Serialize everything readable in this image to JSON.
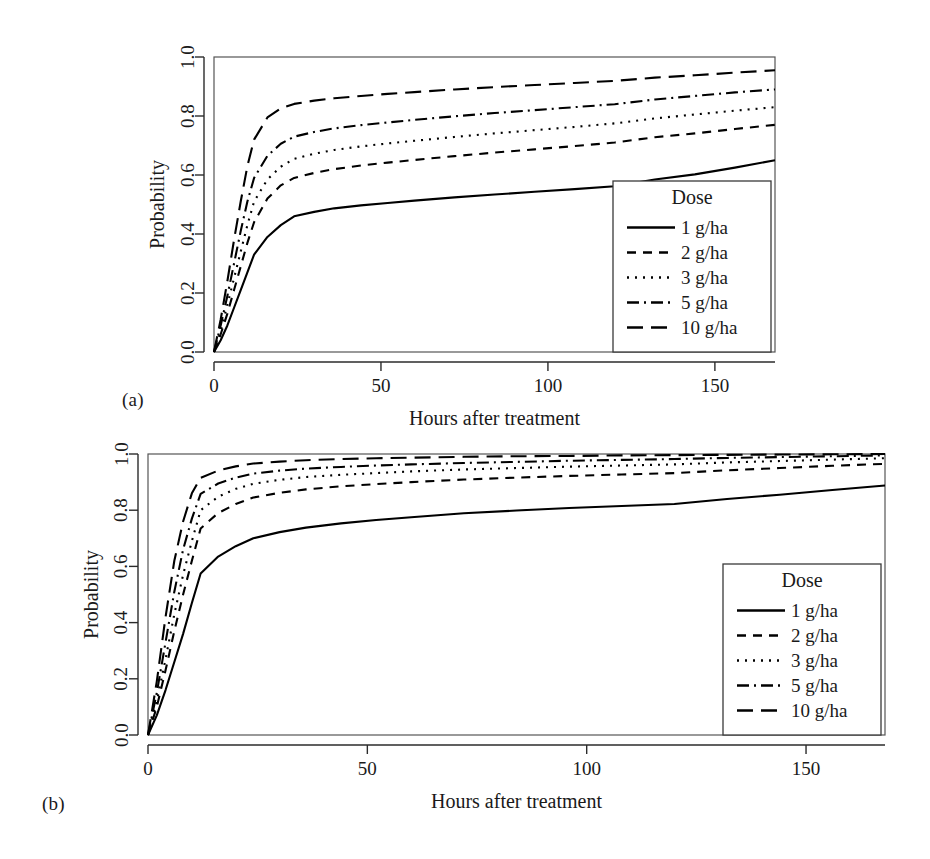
{
  "figure": {
    "panels": [
      {
        "id": "a",
        "caption": "(a)"
      },
      {
        "id": "b",
        "caption": "(b)"
      }
    ]
  },
  "chart_data": [
    {
      "panel": "a",
      "type": "line",
      "title": "",
      "xlabel": "Hours after treatment",
      "ylabel": "Probability",
      "xlim": [
        0,
        168
      ],
      "ylim": [
        0,
        1.0
      ],
      "xticks": [
        0,
        50,
        100,
        150
      ],
      "yticks": [
        0.0,
        0.2,
        0.4,
        0.6,
        0.8,
        1.0
      ],
      "ytick_labels": [
        "0.0",
        "0.2",
        "0.4",
        "0.6",
        "0.8",
        "1.0"
      ],
      "xtick_labels": [
        "0",
        "50",
        "100",
        "150"
      ],
      "grid": false,
      "legend": {
        "title": "Dose",
        "position": "bottom-right",
        "entries": [
          {
            "label": "1 g/ha",
            "dash": "solid"
          },
          {
            "label": "2 g/ha",
            "dash": "dashed"
          },
          {
            "label": "3 g/ha",
            "dash": "dotted"
          },
          {
            "label": "5 g/ha",
            "dash": "dashdot"
          },
          {
            "label": "10 g/ha",
            "dash": "longdash"
          }
        ]
      },
      "x": [
        0,
        2,
        4,
        6,
        8,
        10,
        12,
        16,
        20,
        24,
        30,
        36,
        44,
        52,
        60,
        72,
        84,
        96,
        108,
        120,
        132,
        144,
        156,
        168
      ],
      "series": [
        {
          "name": "1 g/ha",
          "dash": "solid",
          "values": [
            0.0,
            0.04,
            0.09,
            0.15,
            0.21,
            0.27,
            0.33,
            0.39,
            0.43,
            0.46,
            0.475,
            0.487,
            0.497,
            0.505,
            0.513,
            0.524,
            0.534,
            0.543,
            0.552,
            0.562,
            0.585,
            0.602,
            0.625,
            0.65
          ]
        },
        {
          "name": "2 g/ha",
          "dash": "dashed",
          "values": [
            0.0,
            0.06,
            0.13,
            0.21,
            0.29,
            0.37,
            0.44,
            0.52,
            0.565,
            0.59,
            0.607,
            0.62,
            0.632,
            0.642,
            0.651,
            0.664,
            0.676,
            0.687,
            0.698,
            0.71,
            0.728,
            0.741,
            0.756,
            0.77
          ]
        },
        {
          "name": "3 g/ha",
          "dash": "dotted",
          "values": [
            0.0,
            0.07,
            0.16,
            0.25,
            0.34,
            0.43,
            0.51,
            0.585,
            0.628,
            0.655,
            0.672,
            0.685,
            0.697,
            0.707,
            0.716,
            0.729,
            0.741,
            0.752,
            0.763,
            0.775,
            0.792,
            0.805,
            0.818,
            0.83
          ]
        },
        {
          "name": "5 g/ha",
          "dash": "dashdot",
          "values": [
            0.0,
            0.09,
            0.19,
            0.3,
            0.41,
            0.51,
            0.59,
            0.665,
            0.706,
            0.73,
            0.746,
            0.758,
            0.769,
            0.778,
            0.787,
            0.799,
            0.81,
            0.82,
            0.83,
            0.84,
            0.856,
            0.868,
            0.88,
            0.89
          ]
        },
        {
          "name": "10 g/ha",
          "dash": "longdash",
          "values": [
            0.0,
            0.11,
            0.24,
            0.38,
            0.51,
            0.63,
            0.72,
            0.795,
            0.826,
            0.841,
            0.852,
            0.86,
            0.868,
            0.875,
            0.881,
            0.89,
            0.898,
            0.905,
            0.912,
            0.919,
            0.93,
            0.938,
            0.947,
            0.955
          ]
        }
      ]
    },
    {
      "panel": "b",
      "type": "line",
      "title": "",
      "xlabel": "Hours after treatment",
      "ylabel": "Probability",
      "xlim": [
        0,
        168
      ],
      "ylim": [
        0,
        1.0
      ],
      "xticks": [
        0,
        50,
        100,
        150
      ],
      "yticks": [
        0.0,
        0.2,
        0.4,
        0.6,
        0.8,
        1.0
      ],
      "ytick_labels": [
        "0.0",
        "0.2",
        "0.4",
        "0.6",
        "0.8",
        "1.0"
      ],
      "xtick_labels": [
        "0",
        "50",
        "100",
        "150"
      ],
      "grid": false,
      "legend": {
        "title": "Dose",
        "position": "bottom-right",
        "entries": [
          {
            "label": "1 g/ha",
            "dash": "solid"
          },
          {
            "label": "2 g/ha",
            "dash": "dashed"
          },
          {
            "label": "3 g/ha",
            "dash": "dotted"
          },
          {
            "label": "5 g/ha",
            "dash": "dashdot"
          },
          {
            "label": "10 g/ha",
            "dash": "longdash"
          }
        ]
      },
      "x": [
        0,
        2,
        4,
        6,
        8,
        10,
        12,
        16,
        20,
        24,
        30,
        36,
        44,
        52,
        60,
        72,
        84,
        96,
        108,
        120,
        132,
        144,
        156,
        168
      ],
      "series": [
        {
          "name": "1 g/ha",
          "dash": "solid",
          "values": [
            0.0,
            0.07,
            0.16,
            0.26,
            0.36,
            0.47,
            0.575,
            0.635,
            0.672,
            0.7,
            0.722,
            0.738,
            0.753,
            0.765,
            0.775,
            0.789,
            0.799,
            0.808,
            0.815,
            0.822,
            0.84,
            0.855,
            0.872,
            0.888
          ]
        },
        {
          "name": "2 g/ha",
          "dash": "dashed",
          "values": [
            0.0,
            0.1,
            0.23,
            0.37,
            0.5,
            0.62,
            0.735,
            0.79,
            0.822,
            0.845,
            0.862,
            0.874,
            0.885,
            0.893,
            0.9,
            0.909,
            0.916,
            0.922,
            0.927,
            0.932,
            0.942,
            0.95,
            0.958,
            0.965
          ]
        },
        {
          "name": "3 g/ha",
          "dash": "dotted",
          "values": [
            0.0,
            0.12,
            0.27,
            0.43,
            0.57,
            0.69,
            0.8,
            0.848,
            0.876,
            0.894,
            0.908,
            0.918,
            0.926,
            0.932,
            0.938,
            0.945,
            0.95,
            0.955,
            0.959,
            0.963,
            0.97,
            0.975,
            0.98,
            0.985
          ]
        },
        {
          "name": "5 g/ha",
          "dash": "dashdot",
          "values": [
            0.0,
            0.15,
            0.33,
            0.51,
            0.66,
            0.77,
            0.858,
            0.895,
            0.916,
            0.93,
            0.941,
            0.948,
            0.954,
            0.959,
            0.963,
            0.968,
            0.972,
            0.976,
            0.979,
            0.982,
            0.986,
            0.989,
            0.992,
            0.995
          ]
        },
        {
          "name": "10 g/ha",
          "dash": "longdash",
          "values": [
            0.0,
            0.19,
            0.42,
            0.62,
            0.76,
            0.86,
            0.915,
            0.941,
            0.956,
            0.966,
            0.973,
            0.978,
            0.982,
            0.985,
            0.987,
            0.99,
            0.992,
            0.993,
            0.995,
            0.996,
            0.997,
            0.998,
            0.999,
            1.0
          ]
        }
      ]
    }
  ]
}
